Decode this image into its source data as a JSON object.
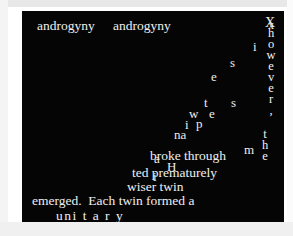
{
  "meta": {
    "colors": {
      "page_background": "#ffffff",
      "canvas_background": "#050505",
      "text": "#ececec",
      "frame": "#f0f0f0"
    }
  },
  "canvas": {
    "top_line": {
      "word_1": "androgyny",
      "word_2": "androgyny"
    },
    "vertical_however": {
      "text": "however,",
      "letters": [
        "h",
        "o",
        "w",
        "e",
        "v",
        "e",
        "r",
        ","
      ]
    },
    "vertical_the": {
      "text": "the",
      "letters": [
        "t",
        "h",
        "e"
      ]
    },
    "overlap_top_right": {
      "glyph_1": "X",
      "glyph_2": "x"
    },
    "scattered_letters": [
      {
        "char": "i",
        "x": 253,
        "y": 40
      },
      {
        "char": "s",
        "x": 230,
        "y": 56
      },
      {
        "char": "e",
        "x": 211,
        "y": 70
      },
      {
        "char": "t",
        "x": 204,
        "y": 96
      },
      {
        "char": "s",
        "x": 231,
        "y": 96
      },
      {
        "char": "w",
        "x": 189,
        "y": 107
      },
      {
        "char": "e",
        "x": 209,
        "y": 107
      },
      {
        "char": "i",
        "x": 185,
        "y": 118
      },
      {
        "char": "p",
        "x": 196,
        "y": 117
      },
      {
        "char": "na",
        "x": 174,
        "y": 128
      },
      {
        "char": "a",
        "x": 154,
        "y": 152
      },
      {
        "char": "H",
        "x": 167,
        "y": 160
      },
      {
        "char": "i",
        "x": 153,
        "y": 170
      },
      {
        "char": "m",
        "x": 244,
        "y": 143
      }
    ],
    "lines": [
      {
        "id": "broke-through",
        "text": "broke through"
      },
      {
        "id": "ted-prematurely",
        "text": "ted prematurely"
      },
      {
        "id": "wiser-twin",
        "text": "wiser twin"
      },
      {
        "id": "emerged-each",
        "text": "emerged.  Each twin formed a"
      },
      {
        "id": "unitary",
        "text": "uni t a r y"
      }
    ]
  }
}
